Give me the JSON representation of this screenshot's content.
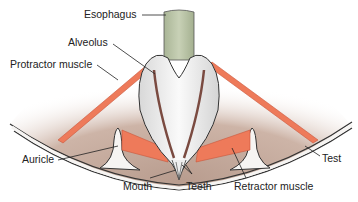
{
  "diagram": {
    "labels": {
      "esophagus": "Esophagus",
      "alveolus": "Alveolus",
      "protractor": "Protractor muscle",
      "auricle": "Auricle",
      "mouth": "Mouth",
      "teeth": "Teeth",
      "retractor": "Retractor muscle",
      "test": "Test"
    },
    "colors": {
      "background": "#ffffff",
      "body_cavity": "#c8b0a2",
      "muscle": "#ee7a5a",
      "esophagus": "#b9c4a6",
      "lantern": "#efefef",
      "test_wall": "#f6f4f2",
      "outline": "#333333"
    }
  }
}
